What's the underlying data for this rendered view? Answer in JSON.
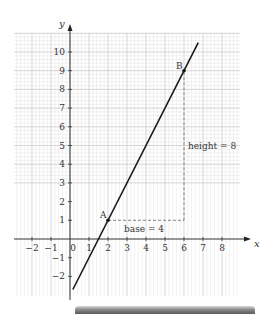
{
  "chart_data": {
    "type": "line",
    "title": "",
    "xlabel": "x",
    "ylabel": "y",
    "xlim": [
      -3,
      9
    ],
    "ylim": [
      -3,
      10.8
    ],
    "grid": true,
    "grid_minor_step": 0.2,
    "x_ticks": [
      -2,
      -1,
      0,
      1,
      2,
      3,
      4,
      5,
      6,
      7,
      8
    ],
    "x_tick_labels": [
      "−2",
      "−1",
      "0",
      "1",
      "2",
      "3",
      "4",
      "5",
      "6",
      "7",
      "8"
    ],
    "y_ticks": [
      -2,
      -1,
      1,
      2,
      3,
      4,
      5,
      6,
      7,
      8,
      9,
      10
    ],
    "y_tick_labels": [
      "−2",
      "−1",
      "1",
      "2",
      "3",
      "4",
      "5",
      "6",
      "7",
      "8",
      "9",
      "10"
    ],
    "series": [
      {
        "name": "y = 2x − 3",
        "equation": "y = 2x - 3",
        "x": [
          0.15,
          6.75
        ],
        "y": [
          -2.7,
          10.5
        ],
        "color": "#1a1a1a"
      }
    ],
    "points": [
      {
        "label": "A",
        "x": 2,
        "y": 1
      },
      {
        "label": "B",
        "x": 6,
        "y": 9
      }
    ],
    "annotations": [
      {
        "text": "base = 4",
        "type": "dashed-horizontal",
        "from": [
          2,
          1
        ],
        "to": [
          6,
          1
        ]
      },
      {
        "text": "height = 8",
        "type": "dashed-vertical",
        "from": [
          6,
          1
        ],
        "to": [
          6,
          9
        ]
      }
    ]
  },
  "labels": {
    "x_axis": "x",
    "y_axis": "y",
    "point_a": "A",
    "point_b": "B",
    "base": "base = 4",
    "height": "height = 8"
  },
  "colors": {
    "grid_minor": "#e3e3e3",
    "grid_major": "#c4c4c4",
    "axis": "#333333",
    "line": "#1a1a1a",
    "dashed": "#666666"
  }
}
